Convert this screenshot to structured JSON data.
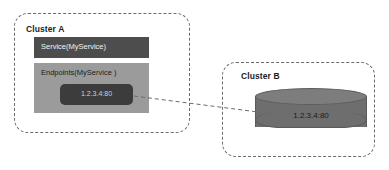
{
  "diagram": {
    "background_color": "#ffffff",
    "clusters": [
      {
        "id": "cluster-a",
        "label": "Cluster A",
        "border_style": "dashed",
        "border_color": "#6b6b6b"
      },
      {
        "id": "cluster-b",
        "label": "Cluster B",
        "border_style": "dashed",
        "border_color": "#6b6b6b"
      }
    ],
    "service": {
      "label": "Service(MyService)",
      "fill_color": "#4d4d4d",
      "text_color": "#f2f2f2"
    },
    "endpoints": {
      "label": "Endpoints(MyService )",
      "fill_color": "#9b9b9b",
      "text_color": "#1c1c1c",
      "address": {
        "label": "1.2.3.4:80",
        "fill_color": "#3c3c3c",
        "text_color": "#cfcfcf"
      }
    },
    "backend": {
      "label": "1.2.3.4:80",
      "shape": "cylinder",
      "fill_color": "#6e6e6e",
      "top_color": "#7d7d7d",
      "text_color": "#1a1a1a"
    },
    "connector": {
      "style": "dashed",
      "color": "#6b6b6b",
      "from": "endpoint-address-chip",
      "to": "backend-cylinder"
    }
  }
}
